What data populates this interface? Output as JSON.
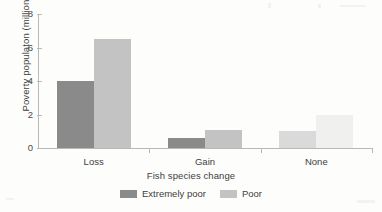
{
  "chart_data": {
    "type": "bar",
    "title": "",
    "xlabel": "Fish species change",
    "ylabel": "Poverty populaton (millions)",
    "categories": [
      "Loss",
      "Gain",
      "None"
    ],
    "series": [
      {
        "name": "Extremely poor",
        "color": "#8a8a8a",
        "values": [
          4.0,
          0.6,
          1.0
        ]
      },
      {
        "name": "Poor",
        "color": "#c3c3c3",
        "values": [
          6.5,
          1.1,
          2.0
        ]
      }
    ],
    "ylim": [
      0,
      8
    ],
    "yticks": [
      0,
      2,
      4,
      6,
      8
    ],
    "ytick_labels": [
      "0",
      "2",
      "4",
      "6",
      "8"
    ],
    "grid": false,
    "legend_position": "bottom",
    "group_faded": [
      false,
      false,
      true
    ]
  },
  "legend": {
    "items": [
      {
        "label": "Extremely poor",
        "color": "#8a8a8a"
      },
      {
        "label": "Poor",
        "color": "#c3c3c3"
      }
    ]
  }
}
